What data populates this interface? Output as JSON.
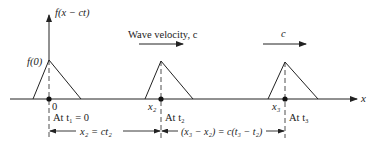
{
  "diagram": {
    "vertical_axis_label": "f(x − ct)",
    "horizontal_axis_label": "x",
    "peak_label": "f(0)",
    "velocity_label": "Wave velocity, c",
    "velocity_label_short": "c",
    "positions": [
      {
        "x_label": "0",
        "time_label": "At t₁ = 0"
      },
      {
        "x_label": "x₂",
        "time_label": "At t₂"
      },
      {
        "x_label": "x₃",
        "time_label": "At t₃"
      }
    ],
    "dimensions": [
      {
        "label": "x₂ = ct₂"
      },
      {
        "label": "(x₃ − x₂) = c(t₃ − t₂)"
      }
    ],
    "colors": {
      "ink": "#222222",
      "background": "#ffffff"
    }
  }
}
